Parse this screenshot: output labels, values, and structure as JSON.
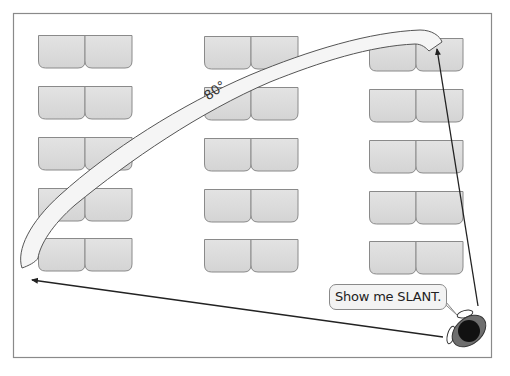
{
  "diagram": {
    "frame": {
      "x": 13,
      "y": 13,
      "width": 479,
      "height": 345,
      "stroke": "#8a8a8a"
    },
    "desk_style": {
      "fill": "#dcdcdc",
      "stroke": "#8a8a8a",
      "width": 47,
      "height": 33,
      "corner_radius": 7
    },
    "desk_columns": [
      {
        "name": "left",
        "x": 38
      },
      {
        "name": "middle",
        "x": 204
      },
      {
        "name": "right",
        "x": 369
      }
    ],
    "desk_rows_y": [
      35,
      86,
      137,
      188,
      238
    ],
    "desks_per_group": 2,
    "curved_arrow": {
      "label": "80°",
      "fill": "#f4f4f4",
      "stroke": "#555555",
      "description": "Wide curved band sweeping from the top-right desk area down to the lower-left corner"
    },
    "straight_arrows": [
      {
        "name": "arrow-to-top-right-desk",
        "from": [
          472,
          308
        ],
        "to": [
          436,
          50
        ],
        "color": "#222222"
      },
      {
        "name": "arrow-to-bottom-left",
        "from": [
          444,
          323
        ],
        "to": [
          32,
          280
        ],
        "color": "#222222"
      }
    ],
    "speech_bubble": {
      "text": "Show me SLANT.",
      "fill": "#f3f3f3",
      "stroke": "#8a8a8a"
    },
    "teacher": {
      "description": "Top-down view of a person (teacher) with black head and grey shoulders",
      "head_color": "#111111",
      "body_color": "#6e6e6e"
    }
  }
}
